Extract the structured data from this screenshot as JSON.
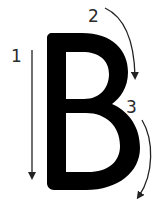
{
  "diagram": {
    "letter": "B",
    "colors": {
      "background": "#ffffff",
      "letter": "#000000",
      "arrow": "#222222",
      "label": "#2a2a2a"
    },
    "steps": [
      {
        "number": "1",
        "description": "straight line down (stem)"
      },
      {
        "number": "2",
        "description": "curve down around upper bowl"
      },
      {
        "number": "3",
        "description": "curve down around lower bowl"
      }
    ]
  }
}
